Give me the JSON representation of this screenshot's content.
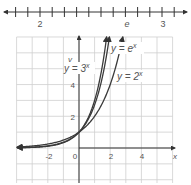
{
  "number_line": {
    "start": 1.95,
    "end": 3.05,
    "tick_step": 0.1,
    "labels": [
      {
        "value": 2,
        "text": "2"
      },
      {
        "value": 2.718,
        "text": "e"
      },
      {
        "value": 3,
        "text": "3"
      }
    ]
  },
  "graph": {
    "x_axis_label": "x",
    "y_axis_label": "y",
    "x_tick_labels": [
      "-2",
      "0",
      "2",
      "4"
    ],
    "y_tick_labels": [
      "2",
      "4"
    ],
    "curve_labels": {
      "three": {
        "text": "y = 3",
        "exp": "x"
      },
      "e": {
        "text": "y = e",
        "exp": "x"
      },
      "two": {
        "text": "y = 2",
        "exp": "x"
      }
    }
  },
  "colors": {
    "curve": "#3a3a3a",
    "grid": "#cfcfcf",
    "axis": "#333333",
    "text": "#555555"
  },
  "chart_data": {
    "type": "line",
    "title": "",
    "xlabel": "x",
    "ylabel": "y",
    "xlim": [
      -4,
      6
    ],
    "ylim": [
      -2,
      7
    ],
    "grid": true,
    "legend": "inline labels",
    "series": [
      {
        "name": "y = 3^x",
        "function": "3^x",
        "x": [
          -3.9,
          -3,
          -2,
          -1,
          0,
          1,
          1.5,
          1.77
        ],
        "values": [
          0.014,
          0.037,
          0.111,
          0.333,
          1,
          3,
          5.196,
          7
        ]
      },
      {
        "name": "y = e^x",
        "function": "e^x",
        "x": [
          -3.9,
          -3,
          -2,
          -1,
          0,
          1,
          1.5,
          1.95
        ],
        "values": [
          0.02,
          0.05,
          0.135,
          0.368,
          1,
          2.718,
          4.482,
          7
        ]
      },
      {
        "name": "y = 2^x",
        "function": "2^x",
        "x": [
          -3.9,
          -3,
          -2,
          -1,
          0,
          1,
          2,
          2.81
        ],
        "values": [
          0.067,
          0.125,
          0.25,
          0.5,
          1,
          2,
          4,
          7
        ]
      }
    ],
    "number_line": {
      "range": [
        1.95,
        3.05
      ],
      "tick_step": 0.1,
      "labels": [
        "2",
        "e",
        "3"
      ]
    }
  }
}
